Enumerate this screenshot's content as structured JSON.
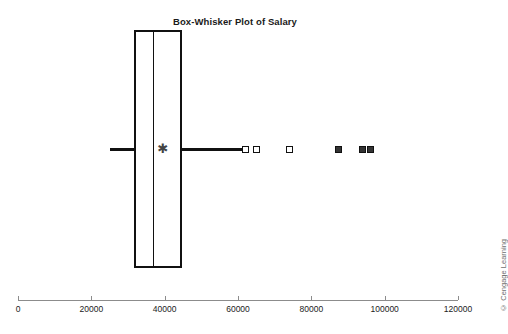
{
  "chart_data": {
    "type": "box",
    "title": "Box-Whisker Plot of Salary",
    "xlabel": "",
    "ylabel": "",
    "xlim": [
      0,
      120000
    ],
    "grid": false,
    "orientation": "horizontal",
    "legend": null,
    "tick_labels": [
      "0",
      "20000",
      "40000",
      "60000",
      "80000",
      "100000",
      "120000"
    ],
    "tick_values": [
      0,
      20000,
      40000,
      60000,
      80000,
      100000,
      120000
    ],
    "series": [
      {
        "name": "Salary",
        "min_whisker": 25000,
        "q1": 31600,
        "median": 36800,
        "mean": 39500,
        "q3": 44700,
        "max_whisker": 60500,
        "mean_marker": "asterisk",
        "outliers_mild": [
          62000,
          65000,
          74000
        ],
        "outliers_extreme": [
          87500,
          94000,
          96000
        ]
      }
    ],
    "annotations": [
      "© Cengage Learning"
    ]
  },
  "figure": {
    "title": "Box-Whisker Plot of Salary",
    "credit": "© Cengage Learning",
    "axis": {
      "ticks": [
        {
          "label": "0",
          "value": 0
        },
        {
          "label": "20000",
          "value": 20000
        },
        {
          "label": "40000",
          "value": 40000
        },
        {
          "label": "60000",
          "value": 60000
        },
        {
          "label": "80000",
          "value": 80000
        },
        {
          "label": "100000",
          "value": 100000
        },
        {
          "label": "120000",
          "value": 120000
        }
      ]
    },
    "colors": {
      "ink": "#111111",
      "axis": "#8c8c8c",
      "credit": "#6e6e6e",
      "background": "#ffffff"
    }
  }
}
